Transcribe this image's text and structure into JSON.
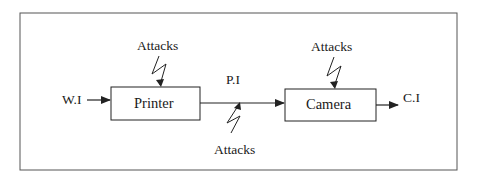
{
  "diagram": {
    "type": "block-flow",
    "frame": {
      "stroke": "#555555"
    },
    "colors": {
      "line": "#222222",
      "background": "#ffffff"
    },
    "nodes": [
      {
        "id": "printer",
        "label": "Printer"
      },
      {
        "id": "camera",
        "label": "Camera"
      }
    ],
    "signals": {
      "input": "W.I",
      "intermediate": "P.I",
      "output": "C.I"
    },
    "attacks": [
      {
        "target": "printer",
        "label": "Attacks",
        "position": "top"
      },
      {
        "target": "intermediate-link",
        "label": "Attacks",
        "position": "bottom"
      },
      {
        "target": "camera",
        "label": "Attacks",
        "position": "top"
      }
    ],
    "edges": [
      {
        "from": "W.I",
        "to": "printer"
      },
      {
        "from": "printer",
        "to": "camera",
        "label": "P.I"
      },
      {
        "from": "camera",
        "to": "C.I"
      }
    ]
  }
}
